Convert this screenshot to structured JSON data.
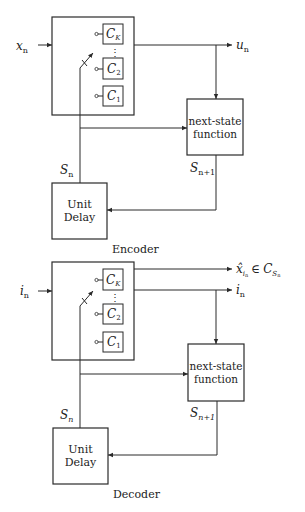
{
  "encoder": {
    "title": "Encoder",
    "input_label": "x",
    "input_sub": "n",
    "output_label": "u",
    "output_sub": "n",
    "codebooks": [
      {
        "label": "C",
        "sub": "K"
      },
      {
        "label": "C",
        "sub": "2"
      },
      {
        "label": "C",
        "sub": "1"
      }
    ],
    "next_state": {
      "line1": "next-state",
      "line2": "function"
    },
    "unit_delay": {
      "line1": "Unit",
      "line2": "Delay"
    },
    "state_label": "S",
    "state_sub": "n",
    "next_state_label": "S",
    "next_state_sub": "n+1"
  },
  "decoder": {
    "title": "Decoder",
    "input_label": "i",
    "input_sub": "n",
    "output1_label": "x̂",
    "output1_sub": "i",
    "output1_subsub": "n",
    "output1_rel": "∈",
    "output1_set": "C",
    "output1_set_sub": "S",
    "output1_set_subsub": "n",
    "output2_label": "i",
    "output2_sub": "n",
    "codebooks": [
      {
        "label": "C",
        "sub": "K"
      },
      {
        "label": "C",
        "sub": "2"
      },
      {
        "label": "C",
        "sub": "1"
      }
    ],
    "next_state": {
      "line1": "next-state",
      "line2": "function"
    },
    "unit_delay": {
      "line1": "Unit",
      "line2": "Delay"
    },
    "state_label": "S",
    "state_sub": "n",
    "next_state_label": "S",
    "next_state_sub": "n+1"
  },
  "vdots": "⋮"
}
